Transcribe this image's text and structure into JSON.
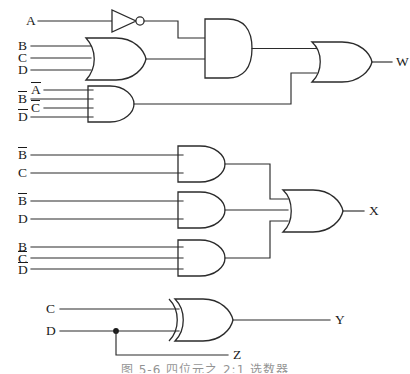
{
  "figure": {
    "caption": "图 5-6  四位元之 2:1 选数器",
    "stroke_color": "#2b2b2b",
    "text_color": "#1a1a1a",
    "background": "#ffffff"
  },
  "sections": {
    "w": {
      "output_label": "W",
      "inverter_input_label": "A",
      "or_inputs": [
        "B",
        "C",
        "D"
      ],
      "and_inputs": [
        "A̅",
        "B̅",
        "C̅",
        "D̅"
      ],
      "and_input_labels": {
        "a_bar": "A",
        "b_bar": "B",
        "c_bar": "C",
        "d_bar": "D"
      }
    },
    "x": {
      "output_label": "X",
      "and1_inputs": [
        "B̅",
        "C"
      ],
      "and1_labels": {
        "b_bar": "B",
        "c": "C"
      },
      "and2_inputs": [
        "B̅",
        "D"
      ],
      "and2_labels": {
        "b_bar": "B",
        "d": "D"
      },
      "and3_inputs": [
        "B",
        "C̅",
        "D̅"
      ],
      "and3_labels": {
        "b": "B",
        "c_bar": "C",
        "d_bar": "D"
      }
    },
    "y": {
      "output_label": "Y",
      "tap_output_label": "Z",
      "xor_inputs": [
        "C",
        "D"
      ],
      "xor_labels": {
        "c": "C",
        "d": "D"
      }
    }
  },
  "gates": [
    {
      "id": "inv-a",
      "type": "NOT",
      "output": "A̅"
    },
    {
      "id": "or-bcd",
      "type": "OR",
      "inputs": [
        "B",
        "C",
        "D"
      ]
    },
    {
      "id": "and-nabcd",
      "type": "AND",
      "inputs": [
        "A̅",
        "B̅",
        "C̅",
        "D̅"
      ]
    },
    {
      "id": "and-top",
      "type": "AND",
      "inputs": [
        "A̅",
        "B+C+D"
      ]
    },
    {
      "id": "or-w",
      "type": "OR",
      "output": "W"
    },
    {
      "id": "and-x1",
      "type": "AND",
      "inputs": [
        "B̅",
        "C"
      ]
    },
    {
      "id": "and-x2",
      "type": "AND",
      "inputs": [
        "B̅",
        "D"
      ]
    },
    {
      "id": "and-x3",
      "type": "AND",
      "inputs": [
        "B",
        "C̅",
        "D̅"
      ]
    },
    {
      "id": "or-x",
      "type": "OR",
      "output": "X"
    },
    {
      "id": "xor-y",
      "type": "XOR",
      "inputs": [
        "C",
        "D"
      ],
      "output": "Y"
    }
  ]
}
